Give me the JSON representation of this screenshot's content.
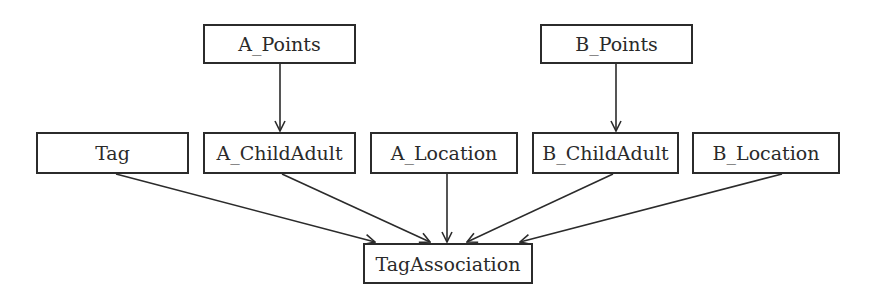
{
  "diagram": {
    "type": "directed-graph",
    "line_color": "#2b2b2b",
    "nodes": [
      {
        "id": "a_points",
        "label": "A_Points"
      },
      {
        "id": "b_points",
        "label": "B_Points"
      },
      {
        "id": "tag",
        "label": "Tag"
      },
      {
        "id": "a_childadult",
        "label": "A_ChildAdult"
      },
      {
        "id": "a_location",
        "label": "A_Location"
      },
      {
        "id": "b_childadult",
        "label": "B_ChildAdult"
      },
      {
        "id": "b_location",
        "label": "B_Location"
      },
      {
        "id": "tagassociation",
        "label": "TagAssociation"
      }
    ],
    "edges": [
      {
        "from": "A_Points",
        "to": "A_ChildAdult"
      },
      {
        "from": "B_Points",
        "to": "B_ChildAdult"
      },
      {
        "from": "Tag",
        "to": "TagAssociation"
      },
      {
        "from": "A_ChildAdult",
        "to": "TagAssociation"
      },
      {
        "from": "A_Location",
        "to": "TagAssociation"
      },
      {
        "from": "B_ChildAdult",
        "to": "TagAssociation"
      },
      {
        "from": "B_Location",
        "to": "TagAssociation"
      }
    ]
  }
}
